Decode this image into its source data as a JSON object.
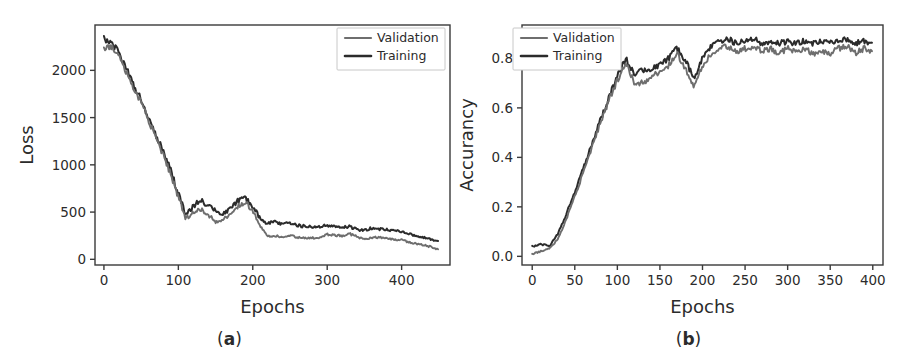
{
  "figure": {
    "panels": [
      {
        "id": "panel-a",
        "subcaption_open": "(",
        "subcaption_letter": "a",
        "subcaption_close": ")"
      },
      {
        "id": "panel-b",
        "subcaption_open": "(",
        "subcaption_letter": "b",
        "subcaption_close": ")"
      }
    ]
  },
  "colors": {
    "training": "#2b2b2b",
    "validation": "#6e6e6e",
    "axis": "#3a3a3a",
    "text": "#2b2b2b",
    "background": "#ffffff",
    "legend_border": "#c8c8c8"
  },
  "chart_data": [
    {
      "type": "line",
      "id": "loss-curve",
      "title": "",
      "xlabel": "Epochs",
      "ylabel": "Loss",
      "xlim": [
        -12,
        465
      ],
      "ylim": [
        -60,
        2480
      ],
      "xticks": [
        0,
        100,
        200,
        300,
        400
      ],
      "xticklabels": [
        "0",
        "100",
        "200",
        "300",
        "400"
      ],
      "yticks": [
        0,
        500,
        1000,
        1500,
        2000
      ],
      "yticklabels": [
        "0",
        "500",
        "1000",
        "1500",
        "2000"
      ],
      "grid": false,
      "legend_position": "upper right",
      "legend": [
        "Validation",
        "Training"
      ],
      "x": [
        0,
        10,
        20,
        30,
        40,
        50,
        60,
        70,
        80,
        90,
        100,
        110,
        120,
        130,
        140,
        150,
        160,
        170,
        180,
        190,
        200,
        210,
        220,
        230,
        240,
        250,
        260,
        270,
        280,
        290,
        300,
        310,
        320,
        330,
        340,
        350,
        360,
        370,
        380,
        390,
        400,
        410,
        420,
        430,
        440,
        450
      ],
      "series": [
        {
          "name": "Training",
          "color": "#2b2b2b",
          "values": [
            2340,
            2300,
            2180,
            2020,
            1850,
            1680,
            1500,
            1320,
            1130,
            930,
            700,
            470,
            560,
            640,
            560,
            520,
            480,
            530,
            620,
            640,
            560,
            430,
            380,
            400,
            370,
            390,
            360,
            350,
            340,
            345,
            360,
            355,
            340,
            345,
            320,
            305,
            330,
            320,
            315,
            300,
            290,
            270,
            250,
            230,
            210,
            190
          ]
        },
        {
          "name": "Validation",
          "color": "#6e6e6e",
          "values": [
            2240,
            2250,
            2140,
            1990,
            1820,
            1650,
            1470,
            1290,
            1100,
            900,
            660,
            430,
            490,
            530,
            470,
            400,
            420,
            470,
            560,
            600,
            520,
            350,
            240,
            250,
            240,
            250,
            235,
            230,
            225,
            235,
            265,
            255,
            250,
            270,
            240,
            215,
            230,
            235,
            225,
            210,
            205,
            180,
            165,
            150,
            130,
            105
          ]
        }
      ]
    },
    {
      "type": "line",
      "id": "accuracy-curve",
      "title": "",
      "xlabel": "Epochs",
      "ylabel": "Accurancy",
      "xlim": [
        -12,
        412
      ],
      "ylim": [
        -0.035,
        0.935
      ],
      "xticks": [
        0,
        50,
        100,
        150,
        200,
        250,
        300,
        350,
        400
      ],
      "xticklabels": [
        "0",
        "50",
        "100",
        "150",
        "200",
        "250",
        "300",
        "350",
        "400"
      ],
      "yticks": [
        0.0,
        0.2,
        0.4,
        0.6,
        0.8
      ],
      "yticklabels": [
        "0.0",
        "0.2",
        "0.4",
        "0.6",
        "0.8"
      ],
      "grid": false,
      "legend_position": "upper left",
      "legend": [
        "Validation",
        "Training"
      ],
      "x": [
        0,
        10,
        20,
        30,
        40,
        50,
        60,
        70,
        80,
        90,
        100,
        110,
        120,
        130,
        140,
        150,
        160,
        170,
        180,
        190,
        200,
        210,
        220,
        230,
        240,
        250,
        260,
        270,
        280,
        290,
        300,
        310,
        320,
        330,
        340,
        350,
        360,
        370,
        380,
        390,
        400
      ],
      "series": [
        {
          "name": "Training",
          "color": "#2b2b2b",
          "values": [
            0.04,
            0.05,
            0.04,
            0.09,
            0.17,
            0.26,
            0.36,
            0.45,
            0.55,
            0.64,
            0.73,
            0.8,
            0.74,
            0.75,
            0.76,
            0.77,
            0.8,
            0.84,
            0.79,
            0.72,
            0.8,
            0.85,
            0.87,
            0.88,
            0.86,
            0.87,
            0.88,
            0.86,
            0.87,
            0.86,
            0.87,
            0.86,
            0.87,
            0.86,
            0.87,
            0.86,
            0.87,
            0.88,
            0.86,
            0.87,
            0.86
          ]
        },
        {
          "name": "Validation",
          "color": "#6e6e6e",
          "values": [
            0.01,
            0.02,
            0.03,
            0.07,
            0.15,
            0.24,
            0.34,
            0.44,
            0.54,
            0.63,
            0.71,
            0.78,
            0.7,
            0.7,
            0.73,
            0.74,
            0.77,
            0.82,
            0.76,
            0.68,
            0.77,
            0.82,
            0.84,
            0.85,
            0.83,
            0.84,
            0.85,
            0.83,
            0.84,
            0.82,
            0.84,
            0.83,
            0.84,
            0.82,
            0.83,
            0.82,
            0.84,
            0.85,
            0.82,
            0.84,
            0.83
          ]
        }
      ]
    }
  ]
}
